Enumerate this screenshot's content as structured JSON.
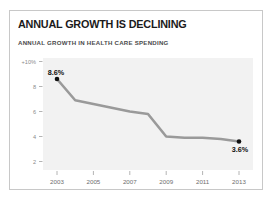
{
  "card": {
    "title": "ANNUAL GROWTH IS DECLINING",
    "subtitle": "ANNUAL GROWTH IN HEALTH CARE SPENDING"
  },
  "colors": {
    "line": "#9a9a9a",
    "marker": "#111111",
    "plot_background": "#f2f2f2",
    "frame_border": "#c8c8c8",
    "title_text": "#1b1b1b",
    "subtitle_text": "#4a4a4a",
    "axis_text": "#8a8a8a",
    "tick": "#b4b4b4"
  },
  "chart_data": {
    "type": "line",
    "title": "ANNUAL GROWTH IS DECLINING",
    "subtitle": "ANNUAL GROWTH IN HEALTH CARE SPENDING",
    "xlabel": "",
    "ylabel": "",
    "grid": false,
    "legend": "none",
    "ylim": [
      0,
      10
    ],
    "xlim": [
      2003,
      2013
    ],
    "ytick_labels": [
      "+10%",
      "8",
      "6",
      "4",
      "2"
    ],
    "ytick_values": [
      10,
      8,
      6,
      4,
      2
    ],
    "xtick_labels": [
      "2003",
      "2005",
      "2007",
      "2009",
      "2011",
      "2013"
    ],
    "xtick_values": [
      2003,
      2005,
      2007,
      2009,
      2011,
      2013
    ],
    "x": [
      2003,
      2004,
      2005,
      2006,
      2007,
      2008,
      2009,
      2010,
      2011,
      2012,
      2013
    ],
    "values": [
      8.6,
      6.9,
      6.6,
      6.3,
      6.0,
      5.8,
      4.0,
      3.9,
      3.9,
      3.8,
      3.6
    ],
    "annotations": [
      {
        "label": "8.6%",
        "x": 2003,
        "y": 8.6,
        "marker": true
      },
      {
        "label": "3.6%",
        "x": 2013,
        "y": 3.6,
        "marker": true
      }
    ]
  }
}
